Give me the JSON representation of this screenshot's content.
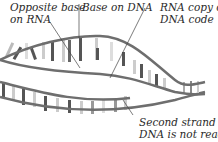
{
  "diagram": {
    "labels": {
      "opposite_base": [
        "Opposite base",
        "on RNA"
      ],
      "base_on_dna": [
        "Base on DNA"
      ],
      "rna_copy": [
        "RNA copy of",
        "DNA code"
      ],
      "second_strand": [
        "Second strand of",
        "DNA is not read"
      ]
    },
    "colors": {
      "backbone": "#6e6e6e",
      "base_dark": "#555555",
      "base_light": "#d8d8d8",
      "text": "#2a2a2a"
    }
  }
}
